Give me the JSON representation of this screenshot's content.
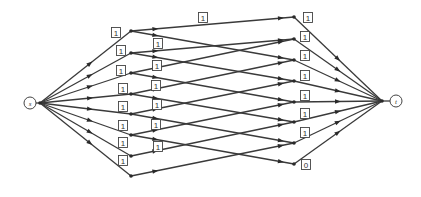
{
  "diagram": {
    "type": "flow-network",
    "source": {
      "id": "s",
      "label": "s",
      "x": 30,
      "y": 103
    },
    "sink": {
      "id": "t",
      "label": "t",
      "x": 396,
      "y": 101
    },
    "source_hub": {
      "x": 40,
      "y": 103
    },
    "sink_hub": {
      "x": 382,
      "y": 101
    },
    "left_nodes": [
      {
        "id": "L1",
        "x": 131,
        "y": 31
      },
      {
        "id": "L2",
        "x": 131,
        "y": 53
      },
      {
        "id": "L3",
        "x": 131,
        "y": 73
      },
      {
        "id": "L4",
        "x": 131,
        "y": 94
      },
      {
        "id": "L5",
        "x": 131,
        "y": 114
      },
      {
        "id": "L6",
        "x": 131,
        "y": 135
      },
      {
        "id": "L7",
        "x": 131,
        "y": 156
      },
      {
        "id": "L8",
        "x": 131,
        "y": 176
      }
    ],
    "right_nodes": [
      {
        "id": "R1",
        "x": 294,
        "y": 17
      },
      {
        "id": "R2",
        "x": 294,
        "y": 39
      },
      {
        "id": "R3",
        "x": 294,
        "y": 60
      },
      {
        "id": "R4",
        "x": 294,
        "y": 81
      },
      {
        "id": "R5",
        "x": 294,
        "y": 102
      },
      {
        "id": "R6",
        "x": 294,
        "y": 122
      },
      {
        "id": "R7",
        "x": 294,
        "y": 143
      },
      {
        "id": "R8",
        "x": 294,
        "y": 164
      }
    ],
    "source_edges": [
      {
        "to": "L1",
        "label": "1",
        "lx": 116,
        "ly": 33
      },
      {
        "to": "L2",
        "label": "1",
        "lx": 121,
        "ly": 51
      },
      {
        "to": "L3",
        "label": "1",
        "lx": 121,
        "ly": 71
      },
      {
        "to": "L4",
        "label": "1",
        "lx": 123,
        "ly": 89
      },
      {
        "to": "L5",
        "label": "1",
        "lx": 123,
        "ly": 107
      },
      {
        "to": "L6",
        "label": "1",
        "lx": 123,
        "ly": 126
      },
      {
        "to": "L7",
        "label": "1",
        "lx": 123,
        "ly": 143
      },
      {
        "to": "L8",
        "label": "1",
        "lx": 123,
        "ly": 161
      }
    ],
    "middle_edges": [
      {
        "from": "L1",
        "to": "R1",
        "label": "1",
        "lx": 203,
        "ly": 18
      },
      {
        "from": "L1",
        "to": "R3"
      },
      {
        "from": "L2",
        "to": "R2",
        "label": "1",
        "lx": 158,
        "ly": 44
      },
      {
        "from": "L2",
        "to": "R4"
      },
      {
        "from": "L3",
        "to": "R2"
      },
      {
        "from": "L3",
        "to": "R5"
      },
      {
        "from": "L4",
        "to": "R3",
        "label": "1",
        "lx": 157,
        "ly": 66
      },
      {
        "from": "L4",
        "to": "R6"
      },
      {
        "from": "L5",
        "to": "R4",
        "label": "1",
        "lx": 156,
        "ly": 86
      },
      {
        "from": "L5",
        "to": "R7"
      },
      {
        "from": "L6",
        "to": "R5",
        "label": "1",
        "lx": 157,
        "ly": 105
      },
      {
        "from": "L6",
        "to": "R8"
      },
      {
        "from": "L7",
        "to": "R6",
        "label": "1",
        "lx": 156,
        "ly": 125
      },
      {
        "from": "L8",
        "to": "R7",
        "label": "1",
        "lx": 158,
        "ly": 147
      }
    ],
    "sink_edges": [
      {
        "from": "R1",
        "label": "1",
        "lx": 308,
        "ly": 18
      },
      {
        "from": "R2",
        "label": "1",
        "lx": 305,
        "ly": 37
      },
      {
        "from": "R3",
        "label": "1",
        "lx": 305,
        "ly": 56
      },
      {
        "from": "R4",
        "label": "1",
        "lx": 305,
        "ly": 76
      },
      {
        "from": "R5",
        "label": "1",
        "lx": 305,
        "ly": 96
      },
      {
        "from": "R6",
        "label": "1",
        "lx": 305,
        "ly": 114
      },
      {
        "from": "R7",
        "label": "1",
        "lx": 305,
        "ly": 133
      },
      {
        "from": "R8",
        "label": "0",
        "lx": 306,
        "ly": 165
      }
    ]
  }
}
